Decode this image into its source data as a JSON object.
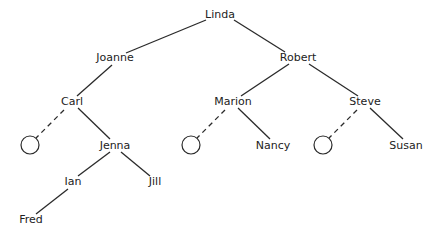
{
  "diagram": {
    "type": "binary-tree",
    "colors": {
      "line": "#2a2a2a",
      "text": "#222222",
      "background": "#ffffff"
    },
    "nodes": [
      {
        "id": "linda",
        "label": "Linda",
        "x": 220,
        "y": 15
      },
      {
        "id": "joanne",
        "label": "Joanne",
        "x": 115,
        "y": 58
      },
      {
        "id": "robert",
        "label": "Robert",
        "x": 298,
        "y": 58
      },
      {
        "id": "carl",
        "label": "Carl",
        "x": 72,
        "y": 102
      },
      {
        "id": "marion",
        "label": "Marion",
        "x": 233,
        "y": 102
      },
      {
        "id": "steve",
        "label": "Steve",
        "x": 365,
        "y": 102
      },
      {
        "id": "jenna",
        "label": "Jenna",
        "x": 115,
        "y": 146
      },
      {
        "id": "nancy",
        "label": "Nancy",
        "x": 273,
        "y": 146
      },
      {
        "id": "susan",
        "label": "Susan",
        "x": 406,
        "y": 146
      },
      {
        "id": "ian",
        "label": "Ian",
        "x": 73,
        "y": 182
      },
      {
        "id": "jill",
        "label": "Jill",
        "x": 155,
        "y": 182
      },
      {
        "id": "fred",
        "label": "Fred",
        "x": 31,
        "y": 220
      }
    ],
    "null_nodes": [
      {
        "id": "carl-left-null",
        "x": 30,
        "y": 145,
        "r": 9
      },
      {
        "id": "marion-left-null",
        "x": 191,
        "y": 145,
        "r": 9
      },
      {
        "id": "steve-left-null",
        "x": 323,
        "y": 145,
        "r": 9
      }
    ],
    "edges": [
      {
        "from": "linda",
        "to": "joanne",
        "x1": 206,
        "y1": 20,
        "x2": 126,
        "y2": 53,
        "dashed": false
      },
      {
        "from": "linda",
        "to": "robert",
        "x1": 234,
        "y1": 20,
        "x2": 285,
        "y2": 52,
        "dashed": false
      },
      {
        "from": "joanne",
        "to": "carl",
        "x1": 112,
        "y1": 65,
        "x2": 77,
        "y2": 96,
        "dashed": false
      },
      {
        "from": "robert",
        "to": "marion",
        "x1": 289,
        "y1": 64,
        "x2": 241,
        "y2": 96,
        "dashed": false
      },
      {
        "from": "robert",
        "to": "steve",
        "x1": 309,
        "y1": 64,
        "x2": 358,
        "y2": 96,
        "dashed": false
      },
      {
        "from": "carl",
        "to": "carl-left-null",
        "x1": 64,
        "y1": 110,
        "x2": 36,
        "y2": 138,
        "dashed": true
      },
      {
        "from": "carl",
        "to": "jenna",
        "x1": 78,
        "y1": 108,
        "x2": 110,
        "y2": 139,
        "dashed": false
      },
      {
        "from": "marion",
        "to": "marion-left-null",
        "x1": 225,
        "y1": 110,
        "x2": 197,
        "y2": 138,
        "dashed": true
      },
      {
        "from": "marion",
        "to": "nancy",
        "x1": 238,
        "y1": 108,
        "x2": 270,
        "y2": 139,
        "dashed": false
      },
      {
        "from": "steve",
        "to": "steve-left-null",
        "x1": 357,
        "y1": 110,
        "x2": 329,
        "y2": 138,
        "dashed": true
      },
      {
        "from": "steve",
        "to": "susan",
        "x1": 370,
        "y1": 108,
        "x2": 403,
        "y2": 139,
        "dashed": false
      },
      {
        "from": "jenna",
        "to": "ian",
        "x1": 110,
        "y1": 152,
        "x2": 78,
        "y2": 176,
        "dashed": false
      },
      {
        "from": "jenna",
        "to": "jill",
        "x1": 121,
        "y1": 152,
        "x2": 150,
        "y2": 176,
        "dashed": false
      },
      {
        "from": "ian",
        "to": "fred",
        "x1": 68,
        "y1": 189,
        "x2": 36,
        "y2": 214,
        "dashed": false
      }
    ]
  }
}
